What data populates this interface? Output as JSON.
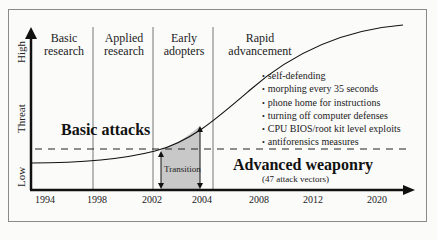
{
  "diagram": {
    "type": "technology adoption S-curve",
    "y_axis": {
      "title": "Threat",
      "high_label": "High",
      "low_label": "Low"
    },
    "x_axis": {
      "ticks": [
        "1994",
        "1998",
        "2002",
        "2004",
        "2008",
        "2012",
        "2020"
      ]
    },
    "phases": [
      {
        "label_line1": "Basic",
        "label_line2": "research"
      },
      {
        "label_line1": "Applied",
        "label_line2": "research"
      },
      {
        "label_line1": "Early",
        "label_line2": "adopters"
      },
      {
        "label_line1": "Rapid",
        "label_line2": "advancement"
      }
    ],
    "threshold_line": "dashed",
    "basic_attacks_label": "Basic attacks",
    "advanced_label": "Advanced weaponry",
    "advanced_sublabel": "(47 attack vectors)",
    "transition_label": "Transition",
    "features": [
      "self-defending",
      "morphing every 35 seconds",
      "phone home for instructions",
      "turning off computer defenses",
      "CPU BIOS/root kit level exploits",
      "antiforensics measures"
    ],
    "colors": {
      "line": "#111111",
      "transition_fill": "#c8c8c8",
      "divider": "#555555",
      "frame": "#8a8a8a"
    }
  }
}
